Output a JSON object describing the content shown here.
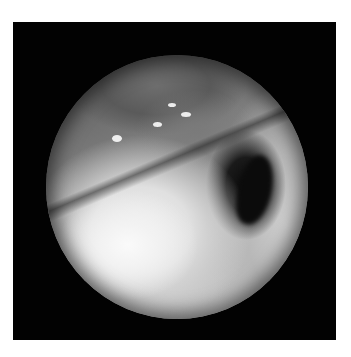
{
  "image": {
    "kind": "grayscale endoscopic photograph",
    "description": "Circular endoscopic field of view on a black square background showing a large bright lobulated mass in the lower-left with a dark crevice on its right edge and vascular-patterned mucosa to the right",
    "colors": {
      "page_background": "#ffffff",
      "frame_background": "#020202",
      "mass_highlight": "#f5f5f5",
      "mucosa_mid": "#b8b8b8",
      "shadow": "#0b0b0b"
    },
    "field_of_view": {
      "shape": "circle",
      "center_x": 177,
      "center_y": 187,
      "radius": 131
    }
  }
}
